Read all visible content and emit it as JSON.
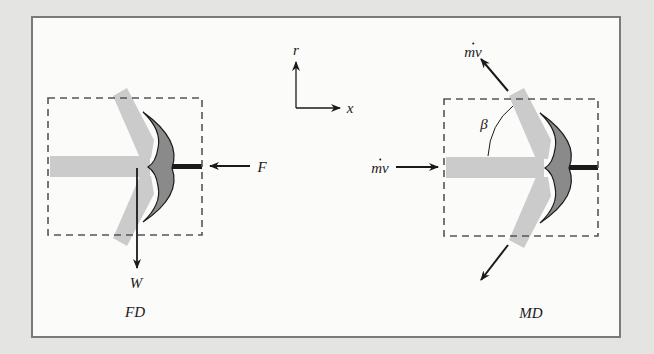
{
  "figure": {
    "panels": [
      {
        "id": "free_body_diagram",
        "caption": "FD",
        "labels": {
          "force_horizontal": "F",
          "force_weight": "W"
        }
      },
      {
        "id": "momentum_diagram",
        "caption": "MD",
        "labels": {
          "inflow_momentum": "mv",
          "outflow_momentum_upper": "mv",
          "deflection_angle": "β"
        }
      }
    ],
    "axes": {
      "vertical": "r",
      "horizontal": "x"
    }
  },
  "colors": {
    "background": "#e4e4e2",
    "frame_fill": "#fbfbfa",
    "frame_border": "#7a7a7a",
    "jet": "#cbcbcb",
    "vane": "#8a8a8a",
    "ink": "#1a1a1a",
    "dashed_box": "#555555"
  }
}
